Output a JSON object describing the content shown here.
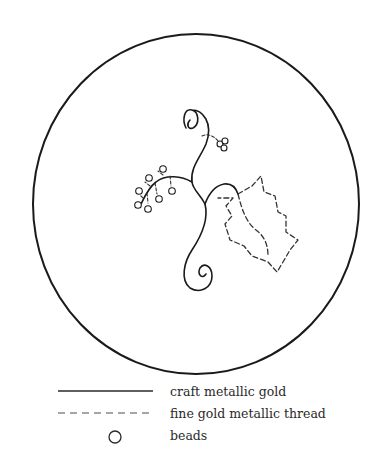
{
  "diagram": {
    "type": "embroidery-pattern",
    "hoop": {
      "shape": "circle"
    }
  },
  "legend": {
    "items": [
      {
        "symbol": "solid-line",
        "label": "craft metallic gold"
      },
      {
        "symbol": "dashed-line",
        "label": "fine gold metallic thread"
      },
      {
        "symbol": "circle",
        "label": "beads"
      }
    ]
  },
  "colors": {
    "line": "#1a1a1a",
    "dashed": "#333333",
    "legend_text": "#2a2a2a",
    "background": "#ffffff"
  }
}
